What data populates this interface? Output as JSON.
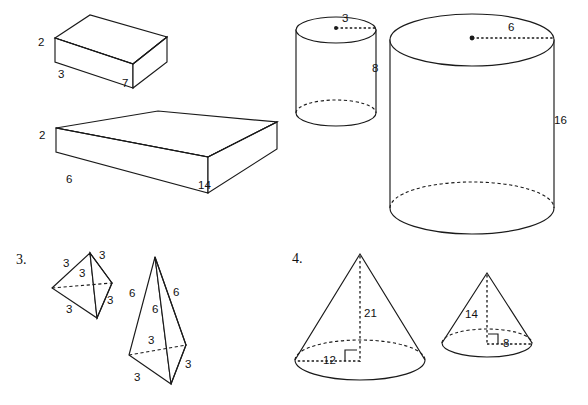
{
  "page": {
    "background_color": "#ffffff",
    "line_color": "#1a1a1a",
    "width": 588,
    "height": 405
  },
  "items": [
    {
      "number_label": "3.",
      "name": "item-3-tetrahedrons"
    },
    {
      "number_label": "4.",
      "name": "item-4-cones"
    }
  ],
  "figures": {
    "small_prism": {
      "name": "small-rectangular-prism",
      "shape": "rectangular prism",
      "height": "2",
      "depth": "3",
      "length": "7"
    },
    "large_prism": {
      "name": "large-rectangular-prism",
      "shape": "rectangular prism",
      "height": "2",
      "depth": "6",
      "length": "14"
    },
    "small_cylinder": {
      "name": "small-cylinder",
      "shape": "cylinder",
      "radius": "3",
      "height": "8"
    },
    "large_cylinder": {
      "name": "large-cylinder",
      "shape": "cylinder",
      "radius": "6",
      "height": "16"
    },
    "small_tetrahedron": {
      "name": "small-tetrahedron",
      "shape": "tetrahedron",
      "edges": [
        "3",
        "3",
        "3",
        "3",
        "3"
      ]
    },
    "large_tetrahedron": {
      "name": "large-tetrahedron",
      "shape": "tetrahedron",
      "edges": [
        "6",
        "6",
        "6",
        "3",
        "3",
        "3"
      ]
    },
    "large_cone": {
      "name": "large-cone",
      "shape": "cone",
      "height": "21",
      "radius": "12"
    },
    "small_cone": {
      "name": "small-cone",
      "shape": "cone",
      "height": "14",
      "radius": "8"
    }
  }
}
